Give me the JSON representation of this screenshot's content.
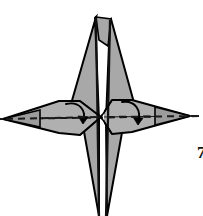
{
  "figure": {
    "kind": "origami-fold-diagram",
    "background_color": "#ffffff",
    "paper_fill_color": "#a8a8a8",
    "paper_fill_color_light": "#b4b4b4",
    "paper_fill_color_dark": "#9a9a9a",
    "outline_color": "#000000",
    "crease_color": "#1a1a1a",
    "arrow_color": "#000000",
    "dashed_axis_color": "#1a1a1a",
    "view_box": "0 0 203 216",
    "width": 203,
    "height": 216
  },
  "geometry": {
    "center": {
      "x": 101,
      "y": 117
    },
    "top_apex_main": {
      "x": 96,
      "y": 17
    },
    "top_apex_second": {
      "x": 110,
      "y": 19
    },
    "bottom_apex_main": {
      "x": 99,
      "y": 216
    },
    "bottom_apex_second": {
      "x": 106,
      "y": 216
    },
    "left_wing_tip": {
      "x": 3,
      "y": 119
    },
    "right_wing_tip": {
      "x": 190,
      "y": 116
    },
    "vertical_crease": {
      "x1": 97,
      "y1": 17,
      "x2": 100,
      "y2": 216
    },
    "vertical_crease_second": {
      "x1": 109,
      "y1": 19,
      "x2": 106,
      "y2": 216
    },
    "dashed_axis": {
      "x1": 1,
      "y1": 119,
      "x2": 203,
      "y2": 116
    }
  },
  "shapes": {
    "body_outline": "M 96,17 L 70,110 L 82,125 L 99,216 L 100,216 L 97,120 L 97,17 Z",
    "body_right_outline": "M 110,19 L 106,120 L 106,216 L 107,216 L 124,126 L 135,110 Z",
    "left_wing": "M 3,119 L 60,101 L 79,101 L 101,117 L 79,134 L 60,133 Z",
    "right_wing": "M 190,116 L 131,100 L 113,100 L 101,117 L 113,134 L 131,132 Z"
  },
  "annotations": {
    "step_number": "7",
    "step_number_clipped": true,
    "arrows": [
      {
        "id": "left-fold-arrow",
        "label": "fold left flap inward and downward",
        "path": "M 66,104 C 78,101 86,110 83,123",
        "head": "M 83,123 L 79,117 L 87,118 Z",
        "direction": "clockwise-inward"
      },
      {
        "id": "right-fold-arrow",
        "label": "fold right flap inward and downward",
        "path": "M 122,102 C 134,100 141,110 137,124",
        "head": "M 137,124 L 133,118 L 141,119 Z",
        "direction": "clockwise-inward"
      }
    ],
    "dashed_lines": [
      {
        "id": "horizontal-fold-axis",
        "label": "horizontal valley fold axis",
        "dash_pattern": "7 5"
      }
    ]
  },
  "accessibility": {
    "alt_text": "Black and white origami instruction diagram showing a gray four-pointed paper form with a tall top point, a long bottom point, and two horizontal wings. A dashed horizontal line runs through the middle, and two curved arrows indicate folding the left and right wings inward."
  }
}
